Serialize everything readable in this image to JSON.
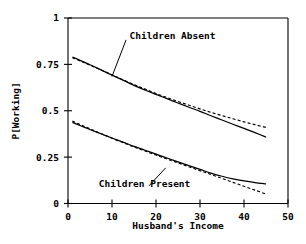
{
  "chart_data": {
    "type": "line",
    "title": "",
    "xlabel": "Husband's Income",
    "ylabel": "P[Working]",
    "xlim": [
      0,
      50
    ],
    "ylim": [
      0,
      1
    ],
    "xticks": [
      0,
      10,
      20,
      30,
      40,
      50
    ],
    "xtick_labels": [
      "0",
      "10",
      "20",
      "30",
      "40",
      "50"
    ],
    "yticks": [
      0,
      0.25,
      0.5,
      0.75,
      1
    ],
    "ytick_labels": [
      "0",
      "0.25",
      "0.5",
      "0.75",
      "1"
    ],
    "grid": false,
    "legend_position": "inline-annotations",
    "annotations": [
      {
        "text": "Children Absent",
        "text_x": 14.0,
        "text_y": 0.905,
        "leader_from_x": 13.2,
        "leader_from_y": 0.882,
        "leader_to_x": 10.0,
        "leader_to_y": 0.685
      },
      {
        "text": "Children Present",
        "text_x": 7.0,
        "text_y": 0.105,
        "leader_from_x": 18.4,
        "leader_from_y": 0.095,
        "leader_to_x": 22.2,
        "leader_to_y": 0.192
      }
    ],
    "series": [
      {
        "name": "Children Absent (solid)",
        "style": "solid",
        "x": [
          1.0,
          3.0,
          5.0,
          7.5,
          10.0,
          12.5,
          15.0,
          17.5,
          20.0,
          22.5,
          25.0,
          27.5,
          30.0,
          32.5,
          35.0,
          37.5,
          40.0,
          42.5,
          45.0
        ],
        "y": [
          0.79,
          0.769,
          0.748,
          0.72,
          0.692,
          0.665,
          0.637,
          0.612,
          0.588,
          0.565,
          0.542,
          0.519,
          0.497,
          0.473,
          0.45,
          0.427,
          0.405,
          0.382,
          0.358
        ]
      },
      {
        "name": "Children Absent (dashed)",
        "style": "dashed",
        "x": [
          1.0,
          3.0,
          5.0,
          7.5,
          10.0,
          12.5,
          15.0,
          17.5,
          20.0,
          22.5,
          25.0,
          27.5,
          30.0,
          32.5,
          35.0,
          37.5,
          40.0,
          42.5,
          45.0
        ],
        "y": [
          0.786,
          0.766,
          0.746,
          0.72,
          0.693,
          0.667,
          0.641,
          0.617,
          0.593,
          0.571,
          0.55,
          0.53,
          0.51,
          0.491,
          0.474,
          0.457,
          0.44,
          0.425,
          0.41
        ]
      },
      {
        "name": "Children Present (solid)",
        "style": "solid",
        "x": [
          1.0,
          3.0,
          5.0,
          7.5,
          10.0,
          12.5,
          15.0,
          17.5,
          20.0,
          22.5,
          25.0,
          27.5,
          30.0,
          32.5,
          35.0,
          37.5,
          40.0,
          42.5,
          45.0
        ],
        "y": [
          0.437,
          0.418,
          0.399,
          0.376,
          0.353,
          0.331,
          0.308,
          0.287,
          0.266,
          0.245,
          0.224,
          0.204,
          0.184,
          0.164,
          0.147,
          0.133,
          0.122,
          0.113,
          0.106
        ]
      },
      {
        "name": "Children Present (dashed)",
        "style": "dashed",
        "x": [
          1.0,
          3.0,
          5.0,
          7.5,
          10.0,
          12.5,
          15.0,
          17.5,
          20.0,
          22.5,
          25.0,
          27.5,
          30.0,
          32.5,
          35.0,
          37.5,
          40.0,
          42.5,
          45.0
        ],
        "y": [
          0.444,
          0.423,
          0.402,
          0.377,
          0.352,
          0.328,
          0.305,
          0.283,
          0.261,
          0.24,
          0.219,
          0.198,
          0.177,
          0.156,
          0.135,
          0.114,
          0.093,
          0.072,
          0.051
        ]
      }
    ]
  },
  "colors": {
    "axis": "#000000",
    "curve": "#000000",
    "background": "#ffffff"
  }
}
